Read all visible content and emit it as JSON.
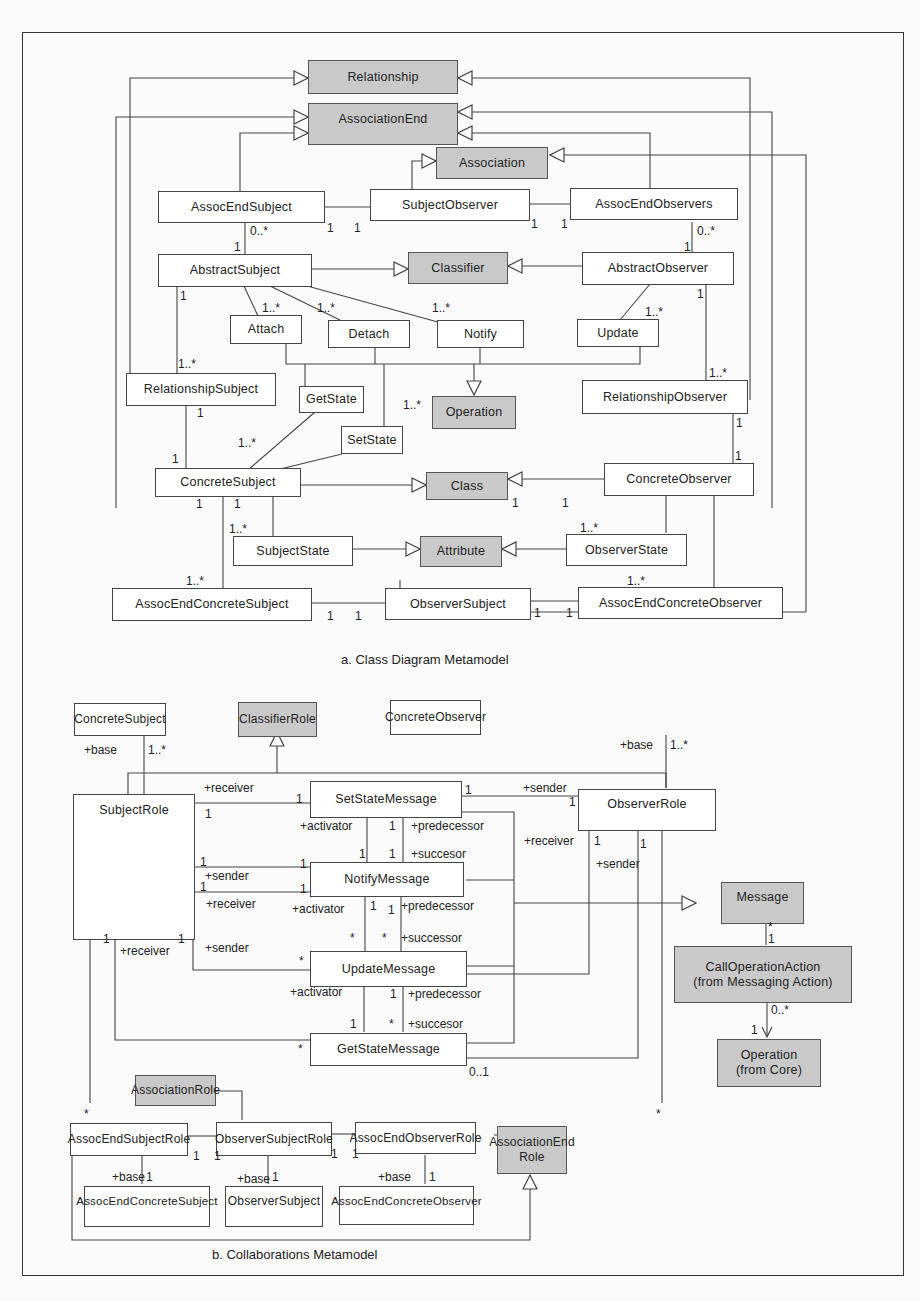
{
  "figure": {
    "captions": {
      "a": "a. Class Diagram Metamodel",
      "b": "b. Collaborations Metamodel"
    },
    "colors": {
      "metaclass_fill": "#c9c9c9",
      "class_fill": "#ffffff",
      "line": "#444444"
    }
  },
  "class_diagram": {
    "metaclasses": {
      "relationship": "Relationship",
      "association_end": "AssociationEnd",
      "association": "Association",
      "classifier": "Classifier",
      "operation": "Operation",
      "class": "Class",
      "attribute": "Attribute"
    },
    "classes": {
      "assoc_end_subject": "AssocEndSubject",
      "subject_observer": "SubjectObserver",
      "assoc_end_observers": "AssocEndObservers",
      "abstract_subject": "AbstractSubject",
      "abstract_observer": "AbstractObserver",
      "attach": "Attach",
      "detach": "Detach",
      "notify": "Notify",
      "update": "Update",
      "relationship_subject": "RelationshipSubject",
      "relationship_observer": "RelationshipObserver",
      "get_state": "GetState",
      "set_state": "SetState",
      "concrete_subject": "ConcreteSubject",
      "concrete_observer": "ConcreteObserver",
      "subject_state": "SubjectState",
      "observer_state": "ObserverState",
      "assoc_end_concrete_subject": "AssocEndConcreteSubject",
      "observer_subject": "ObserverSubject",
      "assoc_end_concrete_observer": "AssocEndConcreteObserver"
    },
    "multiplicities": {
      "one": "1",
      "one_many": "1..*",
      "zero_many": "0..*"
    }
  },
  "collaboration_diagram": {
    "metaclasses": {
      "classifier_role": "ClassifierRole",
      "message": "Message",
      "call_operation_action_1": "CallOperationAction",
      "call_operation_action_2": "(from Messaging Action)",
      "operation_1": "Operation",
      "operation_2": "(from Core)",
      "association_role": "AssociationRole",
      "association_end_role_1": "AssociationEnd",
      "association_end_role_2": "Role"
    },
    "classes": {
      "concrete_subject": "ConcreteSubject",
      "concrete_observer": "ConcreteObserver",
      "subject_role": "SubjectRole",
      "observer_role": "ObserverRole",
      "set_state_message": "SetStateMessage",
      "notify_message": "NotifyMessage",
      "update_message": "UpdateMessage",
      "get_state_message": "GetStateMessage",
      "assoc_end_subject_role": "AssocEndSubjectRole",
      "observer_subject_role": "ObserverSubjectRole",
      "assoc_end_observer_role": "AssocEndObserverRole",
      "assoc_end_concrete_subject": "AssocEndConcreteSubject",
      "observer_subject": "ObserverSubject",
      "assoc_end_concrete_observer": "AssocEndConcreteObserver"
    },
    "roles": {
      "base": "+base",
      "receiver": "+receiver",
      "sender": "+sender",
      "activator": "+activator",
      "predecessor": "+predecessor",
      "succesor": "+succesor",
      "successor": "+successor"
    },
    "multiplicities": {
      "one": "1",
      "one_many": "1..*",
      "many": "*",
      "zero_one": "0..1",
      "zero_many": "0..*"
    }
  }
}
